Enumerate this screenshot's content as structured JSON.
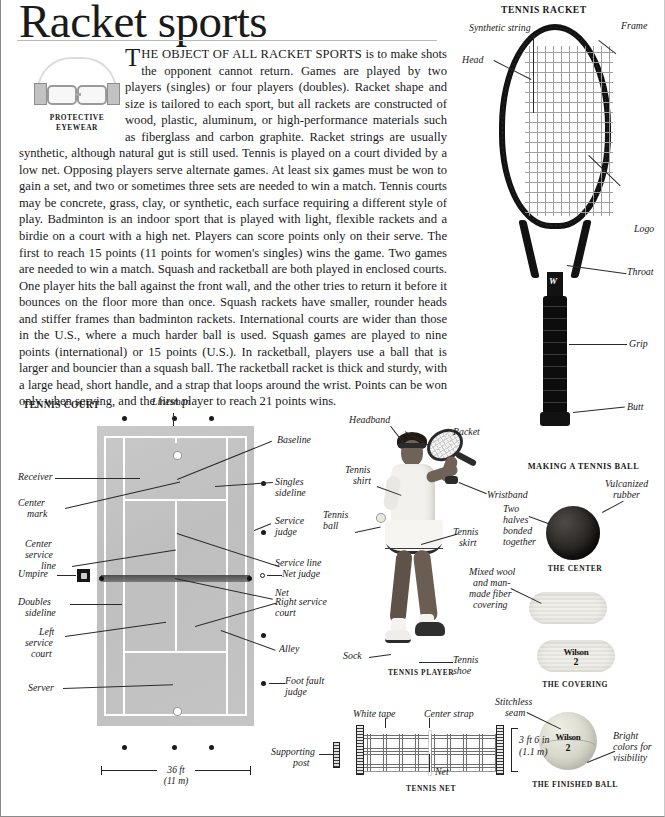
{
  "title": "Racket sports",
  "eyewear_caption_l1": "PROTECTIVE",
  "eyewear_caption_l2": "EYEWEAR",
  "body": {
    "dropcap": "T",
    "lead": "HE OBJECT OF ALL RACKET SPORTS",
    "rest": " is to make shots  the opponent cannot return. Games are played by two players (singles) or four players (doubles). Racket shape and size is tailored to each sport, but all rackets are constructed of wood, plastic, aluminum, or high-performance materials such as fiberglass and carbon graphite. Racket strings are usually synthetic, although natural gut is still used. Tennis is played on a court divided by a low net. Opposing players serve alternate games. At least six games must be won to gain a set, and two or sometimes three sets are needed to win a match. Tennis courts may be concrete, grass, clay, or synthetic, each surface requiring a different style of play. Badminton is an indoor sport that is played with light, flexible rackets and a birdie on a court with a high net. Players can score points only on their serve. The first to reach 15 points (11 points for women's singles) wins the game. Two games are needed to win a match. Squash and racketball are both played in enclosed courts. One player hits the ball against the front wall, and the other tries to return it before it bounces on the floor more than once. Squash rackets have smaller, rounder heads and stiffer frames than badminton rackets. International courts are wider than those in the U.S., where a much harder ball is used. Squash games are played to nine points (international) or 15 points (U.S.). In racketball, players use a ball that is larger and bouncier than a squash ball.  The racketball racket is thick and sturdy, with a large head, short handle, and a strap that loops around the wrist. Points can be won only when serving, and the first player to reach 21 points wins."
  },
  "racket": {
    "title": "TENNIS RACKET",
    "labels": {
      "synthetic_string": "Synthetic string",
      "frame": "Frame",
      "head": "Head",
      "logo": "Logo",
      "throat": "Throat",
      "grip": "Grip",
      "butt": "Butt"
    },
    "brand": "W"
  },
  "court": {
    "title": "TENNIS COURT",
    "labels": {
      "linesman": "Linesman",
      "baseline": "Baseline",
      "singles_sideline_l1": "Singles",
      "singles_sideline_l2": "sideline",
      "receiver": "Receiver",
      "center_mark_l1": "Center",
      "center_mark_l2": "mark",
      "service_judge_l1": "Service",
      "service_judge_l2": "judge",
      "service_line": "Service line",
      "center_service_l1": "Center",
      "center_service_l2": "service",
      "center_service_l3": "line",
      "umpire": "Umpire",
      "net_judge": "Net judge",
      "net": "Net",
      "doubles_sideline_l1": "Doubles",
      "doubles_sideline_l2": "sideline",
      "right_service_l1": "Right service",
      "right_service_l2": "court",
      "left_service_l1": "Left",
      "left_service_l2": "service",
      "left_service_l3": "court",
      "alley": "Alley",
      "foot_fault_l1": "Foot fault",
      "foot_fault_l2": "judge",
      "server": "Server"
    },
    "dimension_ft": "36 ft",
    "dimension_m": "(11 m)"
  },
  "player": {
    "caption": "TENNIS PLAYER",
    "labels": {
      "headband": "Headband",
      "racket": "Racket",
      "tennis_shirt_l1": "Tennis",
      "tennis_shirt_l2": "shirt",
      "wristband": "Wristband",
      "tennis_ball_l1": "Tennis",
      "tennis_ball_l2": "ball",
      "tennis_skirt_l1": "Tennis",
      "tennis_skirt_l2": "skirt",
      "sock": "Sock",
      "tennis_shoe_l1": "Tennis",
      "tennis_shoe_l2": "shoe"
    }
  },
  "ball": {
    "title": "MAKING A TENNIS BALL",
    "center_caption": "THE CENTER",
    "covering_caption": "THE COVERING",
    "finished_caption": "THE FINISHED BALL",
    "labels": {
      "vulcanized_l1": "Vulcanized",
      "vulcanized_l2": "rubber",
      "two_halves_l1": "Two",
      "two_halves_l2": "halves",
      "two_halves_l3": "bonded",
      "two_halves_l4": "together",
      "mixed_wool_l1": "Mixed wool",
      "mixed_wool_l2": "and man-",
      "mixed_wool_l3": "made fiber",
      "mixed_wool_l4": "covering",
      "stitchless_l1": "Stitchless",
      "stitchless_l2": "seam",
      "bright_l1": "Bright",
      "bright_l2": "colors for",
      "bright_l3": "visibility"
    },
    "brand": "Wilson",
    "number": "2"
  },
  "net": {
    "caption": "TENNIS NET",
    "labels": {
      "white_tape": "White tape",
      "center_strap": "Center strap",
      "net": "Net",
      "supporting_post_l1": "Supporting",
      "supporting_post_l2": "post"
    },
    "height_ft": "3 ft 6 in",
    "height_m": "(1.1 m)"
  }
}
